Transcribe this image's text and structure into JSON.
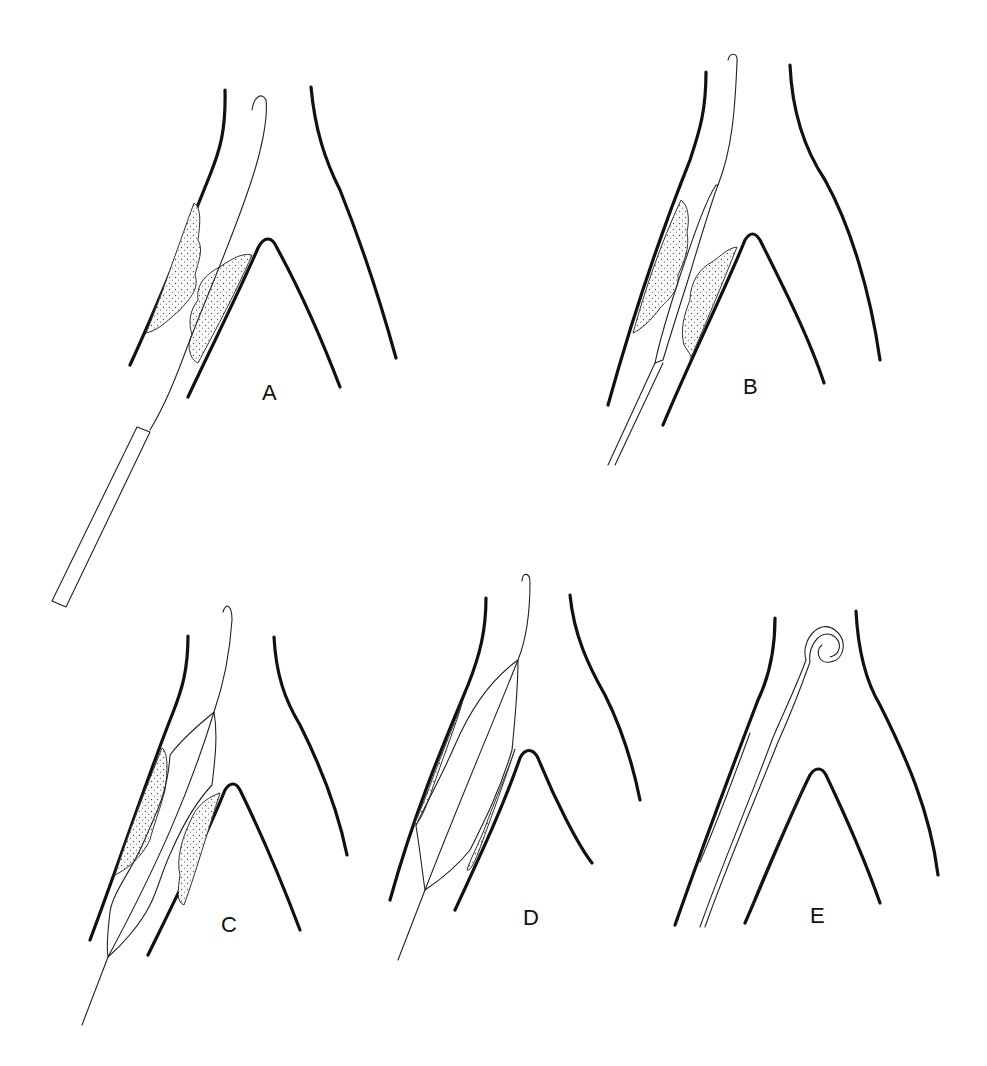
{
  "figure": {
    "panels": [
      {
        "id": "A",
        "label": "A",
        "description": "Guidewire crossing stenosis with plaque on both walls; catheter sheath below"
      },
      {
        "id": "B",
        "label": "B",
        "description": "Deflated balloon catheter positioned across stenosis"
      },
      {
        "id": "C",
        "label": "C",
        "description": "Balloon partially inflated compressing plaque"
      },
      {
        "id": "D",
        "label": "D",
        "description": "Balloon fully inflated, plaque flattened against walls"
      },
      {
        "id": "E",
        "label": "E",
        "description": "Pigtail catheter in dilated vessel after angioplasty"
      }
    ]
  },
  "colors": {
    "background": "#ffffff",
    "line": "#111111",
    "plaque_stipple": "#555555"
  }
}
